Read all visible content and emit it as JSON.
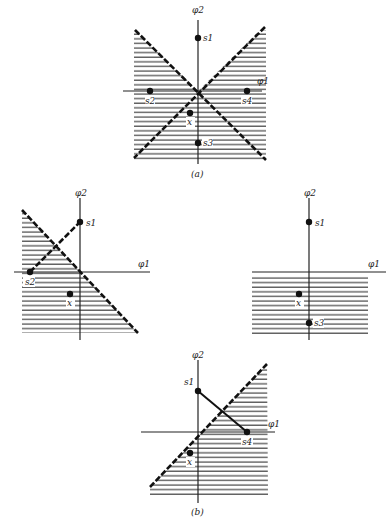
{
  "figure": {
    "panel_a": {
      "caption": "(a)",
      "axis_x_label": "φ1",
      "axis_y_label": "φ2",
      "points": {
        "s1": "s1",
        "s2": "s2",
        "s3": "s3",
        "s4": "s4",
        "x": "x"
      },
      "boundaries": "two dashed diagonal lines crossing at origin"
    },
    "panel_b": {
      "caption": "(b)",
      "left": {
        "axis_x_label": "φ1",
        "axis_y_label": "φ2",
        "points": {
          "s1": "s1",
          "s2": "s2",
          "x": "x"
        }
      },
      "right": {
        "axis_x_label": "φ1",
        "axis_y_label": "φ2",
        "points": {
          "s1": "s1",
          "s3": "s3",
          "x": "x"
        }
      },
      "bottom": {
        "axis_x_label": "φ1",
        "axis_y_label": "φ2",
        "points": {
          "s1": "s1",
          "s4": "s4",
          "x": "x"
        }
      }
    }
  }
}
